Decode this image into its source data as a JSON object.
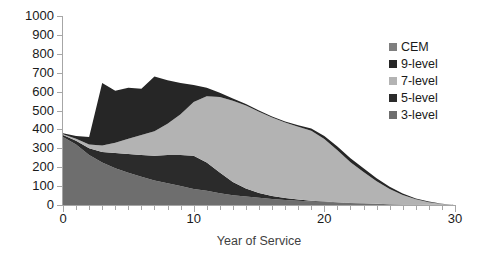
{
  "chart_data": {
    "type": "area",
    "stacked": true,
    "title": "",
    "xlabel": "Year of Service",
    "ylabel": "",
    "xlim": [
      0,
      30
    ],
    "ylim": [
      0,
      1000
    ],
    "x_ticks_major": [
      0,
      10,
      20,
      30
    ],
    "x_tick_labels": [
      "0",
      "10",
      "20",
      "30"
    ],
    "x_tick_minor_step": 1,
    "y_ticks": [
      0,
      100,
      200,
      300,
      400,
      500,
      600,
      700,
      800,
      900,
      1000
    ],
    "y_tick_labels": [
      "0",
      "100",
      "200",
      "300",
      "400",
      "500",
      "600",
      "700",
      "800",
      "900",
      "1000"
    ],
    "grid": false,
    "legend_position": "right",
    "x": [
      0,
      1,
      2,
      3,
      4,
      5,
      6,
      7,
      8,
      9,
      10,
      11,
      12,
      13,
      14,
      15,
      16,
      17,
      18,
      19,
      20,
      21,
      22,
      23,
      24,
      25,
      26,
      27,
      28,
      29,
      30
    ],
    "series": [
      {
        "name": "3-level",
        "color": "#6e6e6e",
        "values": [
          360,
          320,
          265,
          225,
          195,
          170,
          150,
          130,
          115,
          100,
          85,
          75,
          62,
          52,
          45,
          38,
          32,
          27,
          23,
          19,
          16,
          13,
          10,
          8,
          6,
          4,
          3,
          2,
          1,
          0,
          0
        ]
      },
      {
        "name": "5-level",
        "color": "#2b2b2b",
        "values": [
          10,
          20,
          35,
          55,
          80,
          100,
          115,
          130,
          150,
          165,
          175,
          150,
          110,
          70,
          42,
          26,
          16,
          10,
          6,
          4,
          3,
          2,
          1,
          1,
          0,
          0,
          0,
          0,
          0,
          0,
          0
        ]
      },
      {
        "name": "7-level",
        "color": "#b3b3b3",
        "values": [
          5,
          10,
          20,
          35,
          55,
          80,
          105,
          130,
          165,
          215,
          285,
          350,
          400,
          430,
          440,
          430,
          415,
          400,
          385,
          370,
          330,
          275,
          215,
          165,
          120,
          80,
          50,
          28,
          14,
          5,
          0
        ]
      },
      {
        "name": "9-level",
        "color": "#262626",
        "values": [
          5,
          15,
          40,
          330,
          275,
          270,
          245,
          290,
          230,
          165,
          90,
          45,
          22,
          12,
          8,
          6,
          5,
          5,
          8,
          12,
          16,
          20,
          22,
          20,
          16,
          12,
          8,
          5,
          3,
          1,
          0
        ]
      },
      {
        "name": "CEM",
        "color": "#7f7f7f",
        "values": [
          0,
          0,
          0,
          0,
          0,
          0,
          0,
          0,
          0,
          0,
          0,
          0,
          0,
          0,
          0,
          0,
          0,
          0,
          0,
          0,
          0,
          0,
          0,
          0,
          0,
          0,
          0,
          0,
          0,
          0,
          0
        ]
      }
    ],
    "legend_entries": [
      {
        "label": "CEM",
        "color": "#7f7f7f"
      },
      {
        "label": "9-level",
        "color": "#262626"
      },
      {
        "label": "7-level",
        "color": "#b3b3b3"
      },
      {
        "label": "5-level",
        "color": "#2b2b2b"
      },
      {
        "label": "3-level",
        "color": "#6e6e6e"
      }
    ],
    "axis_color": "#a6a6a6",
    "text_color": "#1a1a1a"
  }
}
